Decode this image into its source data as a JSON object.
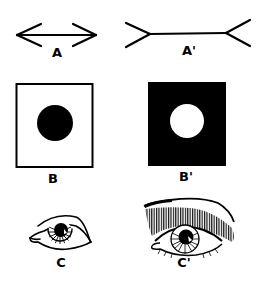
{
  "figure": {
    "panels": [
      {
        "id": "A",
        "label": "A",
        "description": "Line with inward-pointing arrowheads (Müller-Lyer)"
      },
      {
        "id": "A_prime",
        "label": "A'",
        "description": "Line with outward-pointing fins (Müller-Lyer)"
      },
      {
        "id": "B",
        "label": "B",
        "description": "Black circle on white square"
      },
      {
        "id": "B_prime",
        "label": "B'",
        "description": "White circle on black square"
      },
      {
        "id": "C",
        "label": "C",
        "description": "Plain eye outline"
      },
      {
        "id": "C_prime",
        "label": "C'",
        "description": "Eye with shaded/hatched eyelid and lashes"
      }
    ],
    "colors": {
      "ink": "#000000",
      "paper": "#ffffff"
    }
  }
}
